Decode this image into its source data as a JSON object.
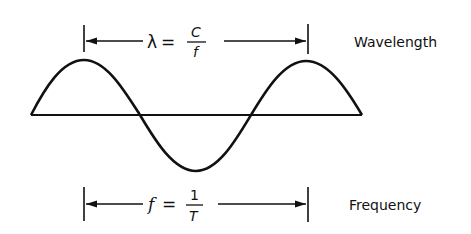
{
  "diagram": {
    "wavelength": {
      "label": "Wavelength",
      "formula_lhs": "λ",
      "equals": "=",
      "numerator": "C",
      "denominator": "f"
    },
    "frequency": {
      "label": "Frequency",
      "formula_lhs": "f",
      "equals": "=",
      "numerator": "1",
      "denominator": "T"
    },
    "colors": {
      "stroke": "#111111",
      "background": "#ffffff"
    }
  }
}
